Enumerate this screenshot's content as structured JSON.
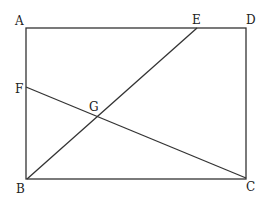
{
  "diagram": {
    "type": "geometry",
    "points": {
      "A": {
        "label": "A",
        "x": 26,
        "y": 28
      },
      "D": {
        "label": "D",
        "x": 245,
        "y": 28
      },
      "E": {
        "label": "E",
        "x": 197,
        "y": 28
      },
      "B": {
        "label": "B",
        "x": 27,
        "y": 179
      },
      "C": {
        "label": "C",
        "x": 246,
        "y": 178
      },
      "F": {
        "label": "F",
        "x": 26,
        "y": 87
      },
      "G": {
        "label": "G",
        "x": 95,
        "y": 116
      }
    },
    "segments": [
      [
        "A",
        "D"
      ],
      [
        "D",
        "C"
      ],
      [
        "C",
        "B"
      ],
      [
        "B",
        "A"
      ],
      [
        "B",
        "E"
      ],
      [
        "F",
        "C"
      ]
    ],
    "stroke_color": "#333333",
    "background": "#ffffff"
  }
}
